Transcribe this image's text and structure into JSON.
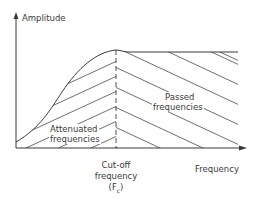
{
  "diagram": {
    "y_axis_label": "Amplitude",
    "x_axis_label": "Frequency",
    "regions": {
      "attenuated": {
        "line1": "Attenuated",
        "line2": "frequencies"
      },
      "passed": {
        "line1": "Passed",
        "line2": "frequencies"
      }
    },
    "cutoff": {
      "line1": "Cut-off",
      "line2": "frequency",
      "line3": "(F",
      "subscript": "c",
      "line3_end": ")"
    },
    "colors": {
      "line": "#3a3a3a",
      "hatch": "#4a4a4a",
      "background": "#ffffff"
    }
  }
}
